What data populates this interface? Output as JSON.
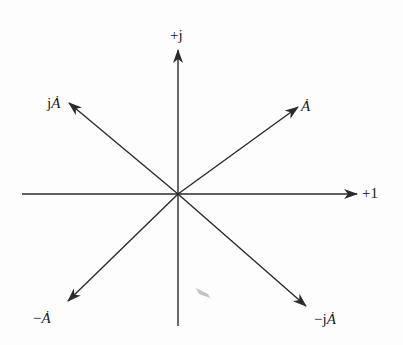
{
  "diagram": {
    "origin": [
      178,
      194
    ],
    "line_color": "#2a2a2a",
    "axes": {
      "real": {
        "label": "+1",
        "from": [
          22,
          194
        ],
        "to": [
          357,
          194
        ],
        "label_pos": [
          362,
          186
        ]
      },
      "imag": {
        "label": "+j",
        "from": [
          178,
          326
        ],
        "to": [
          178,
          50
        ],
        "label_pos": [
          170,
          28
        ]
      }
    },
    "phasors": [
      {
        "id": "A",
        "label": "Ȧ",
        "prefix": "",
        "to": [
          298,
          107
        ],
        "label_pos": [
          301,
          99
        ]
      },
      {
        "id": "jA",
        "label": "Ȧ",
        "prefix": "j",
        "to": [
          69,
          103
        ],
        "label_pos": [
          47,
          96
        ]
      },
      {
        "id": "negA",
        "label": "Ȧ",
        "prefix": "−",
        "to": [
          68,
          301
        ],
        "label_pos": [
          33,
          311
        ]
      },
      {
        "id": "negjA",
        "label": "Ȧ",
        "prefix": "−j",
        "to": [
          306,
          306
        ],
        "label_pos": [
          314,
          312
        ]
      }
    ]
  }
}
